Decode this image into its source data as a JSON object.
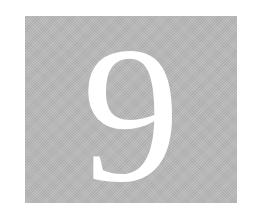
{
  "tile": {
    "numeral": "9",
    "background_color": "#b8b8b8",
    "text_color": "#ffffff"
  }
}
